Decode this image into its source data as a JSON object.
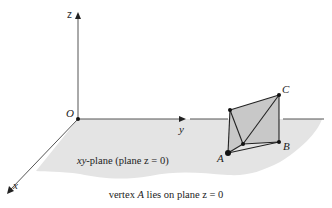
{
  "diagram": {
    "axes": {
      "z_label": "z",
      "y_label": "y",
      "x_label": "x",
      "origin_label": "O"
    },
    "plane_label": "xy-plane (plane z = 0)",
    "plane_label_parts": {
      "italic": "xy",
      "rest": "-plane (plane z = 0)"
    },
    "vertices": {
      "A": "A",
      "B": "B",
      "C": "C"
    },
    "caption": "vertex A lies on plane z = 0",
    "caption_parts": {
      "pre": "vertex ",
      "italic": "A",
      "post": " lies on plane z = 0"
    },
    "colors": {
      "plane_fill": "#e4e4e4",
      "face_fill": "#c8c8c8",
      "axis_stroke": "#555555",
      "edge_stroke": "#222222"
    }
  }
}
